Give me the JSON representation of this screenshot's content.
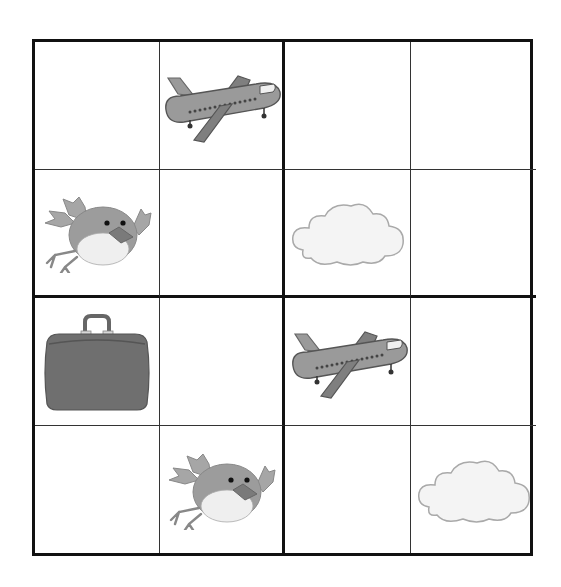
{
  "puzzle": {
    "type": "picture-sudoku",
    "size": 4,
    "box_size": 2,
    "symbols": [
      "airplane",
      "bird",
      "cloud",
      "suitcase"
    ],
    "colors": {
      "grid_line": "#111111",
      "airplane_body": "#9a9a9a",
      "airplane_wing": "#7f7f7f",
      "bird_body": "#9c9c9c",
      "bird_belly": "#efefef",
      "cloud_fill": "#f4f4f4",
      "cloud_stroke": "#a9a9a9",
      "suitcase": "#6f6f6f"
    },
    "grid": [
      [
        "",
        "airplane",
        "",
        ""
      ],
      [
        "bird",
        "",
        "cloud",
        ""
      ],
      [
        "suitcase",
        "",
        "airplane",
        ""
      ],
      [
        "",
        "bird",
        "",
        "cloud"
      ]
    ]
  }
}
